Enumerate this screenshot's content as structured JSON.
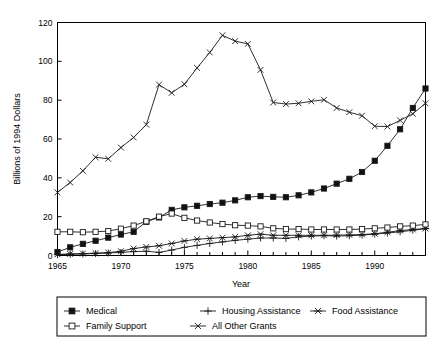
{
  "chart_data": {
    "type": "line",
    "title": "",
    "xlabel": "Year",
    "ylabel": "Billions of 1994 Dollars",
    "xlim": [
      1965,
      1994
    ],
    "ylim": [
      0,
      120
    ],
    "yticks": [
      0,
      20,
      40,
      60,
      80,
      100,
      120
    ],
    "xticks_major": [
      1965,
      1970,
      1975,
      1980,
      1985,
      1990
    ],
    "xticks_minor_step": 1,
    "grid": false,
    "legend_position": "below-plot",
    "x": [
      1965,
      1966,
      1967,
      1968,
      1969,
      1970,
      1971,
      1972,
      1973,
      1974,
      1975,
      1976,
      1977,
      1978,
      1979,
      1980,
      1981,
      1982,
      1983,
      1984,
      1985,
      1986,
      1987,
      1988,
      1989,
      1990,
      1991,
      1992,
      1993,
      1994
    ],
    "series": [
      {
        "name": "Medical",
        "marker": "filled-square",
        "values": [
          1.8,
          4.2,
          6.0,
          7.6,
          9.2,
          10.8,
          12.2,
          17.4,
          19.6,
          23.5,
          24.8,
          25.6,
          26.5,
          27.2,
          28.4,
          30.0,
          30.6,
          30.2,
          30.0,
          31.0,
          32.5,
          34.5,
          37.0,
          39.5,
          43.0,
          48.8,
          56.5,
          65.0,
          76.0,
          86.0
        ]
      },
      {
        "name": "Housing Assistance",
        "marker": "plus",
        "values": [
          0.4,
          0.6,
          0.8,
          1.0,
          1.3,
          1.6,
          2.0,
          2.2,
          1.6,
          2.8,
          4.2,
          5.2,
          6.2,
          7.0,
          7.8,
          8.4,
          9.0,
          9.0,
          8.8,
          9.6,
          10.0,
          10.2,
          10.0,
          10.2,
          10.5,
          11.0,
          11.6,
          12.2,
          13.0,
          13.8
        ]
      },
      {
        "name": "Food Assistance",
        "marker": "asterisk",
        "values": [
          0.6,
          0.8,
          1.0,
          1.2,
          1.5,
          2.2,
          3.6,
          4.4,
          5.0,
          6.2,
          7.5,
          8.4,
          8.8,
          9.2,
          9.6,
          10.4,
          11.0,
          10.4,
          10.4,
          10.4,
          10.4,
          10.4,
          10.5,
          10.6,
          10.8,
          11.2,
          12.0,
          12.8,
          13.4,
          13.9
        ]
      },
      {
        "name": "Family Support",
        "marker": "open-square",
        "values": [
          12.2,
          12.2,
          12.0,
          12.2,
          12.6,
          13.8,
          15.4,
          17.6,
          20.0,
          21.6,
          19.4,
          18.0,
          17.0,
          16.2,
          15.6,
          15.4,
          15.0,
          14.0,
          13.6,
          13.6,
          13.4,
          13.4,
          13.4,
          13.4,
          13.6,
          14.0,
          14.4,
          15.0,
          15.4,
          16.0
        ]
      },
      {
        "name": "All Other Grants",
        "marker": "x-cross",
        "values": [
          32.5,
          37.6,
          43.6,
          50.6,
          49.8,
          55.6,
          60.8,
          67.4,
          88.0,
          83.8,
          88.2,
          96.6,
          104.6,
          113.4,
          110.4,
          109.0,
          95.6,
          78.8,
          78.0,
          78.4,
          79.4,
          80.2,
          76.0,
          73.8,
          72.0,
          66.6,
          66.4,
          69.6,
          73.0,
          78.4
        ]
      }
    ]
  },
  "legend": {
    "items": [
      {
        "label": "Medical",
        "marker": "filled-square"
      },
      {
        "label": "Housing Assistance",
        "marker": "plus"
      },
      {
        "label": "Food Assistance",
        "marker": "asterisk"
      },
      {
        "label": "Family Support",
        "marker": "open-square"
      },
      {
        "label": "All Other Grants",
        "marker": "x-cross"
      }
    ]
  },
  "colors": {
    "line": "#1a1a1a",
    "axis": "#000000",
    "background": "#ffffff"
  }
}
